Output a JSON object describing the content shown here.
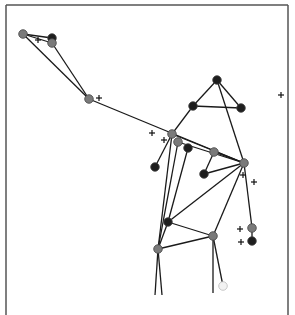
{
  "diagram": {
    "type": "pose-skeleton",
    "frame": {
      "left": 6,
      "top": 5,
      "right": 288,
      "bottom": 315,
      "color": "#555555"
    },
    "colors": {
      "edge": "#1a1a1a",
      "gray_node": "#7a7a7a",
      "dark_node": "#1e1e1e",
      "white_node": "#f2f2f2",
      "marker": "#111111"
    },
    "nodes": [
      {
        "id": "A",
        "x": 23,
        "y": 34,
        "kind": "gray"
      },
      {
        "id": "B",
        "x": 52,
        "y": 38,
        "kind": "dark"
      },
      {
        "id": "C",
        "x": 52,
        "y": 43,
        "kind": "gray"
      },
      {
        "id": "D",
        "x": 89,
        "y": 99,
        "kind": "gray"
      },
      {
        "id": "E",
        "x": 217,
        "y": 80,
        "kind": "dark"
      },
      {
        "id": "F",
        "x": 193,
        "y": 106,
        "kind": "dark"
      },
      {
        "id": "G",
        "x": 241,
        "y": 108,
        "kind": "dark"
      },
      {
        "id": "H",
        "x": 172,
        "y": 134,
        "kind": "gray"
      },
      {
        "id": "I",
        "x": 178,
        "y": 142,
        "kind": "gray"
      },
      {
        "id": "J",
        "x": 188,
        "y": 148,
        "kind": "dark"
      },
      {
        "id": "K",
        "x": 214,
        "y": 152,
        "kind": "gray"
      },
      {
        "id": "L",
        "x": 155,
        "y": 167,
        "kind": "dark"
      },
      {
        "id": "M",
        "x": 204,
        "y": 174,
        "kind": "dark"
      },
      {
        "id": "N",
        "x": 244,
        "y": 163,
        "kind": "gray"
      },
      {
        "id": "O",
        "x": 168,
        "y": 222,
        "kind": "dark"
      },
      {
        "id": "P",
        "x": 213,
        "y": 236,
        "kind": "gray"
      },
      {
        "id": "Q",
        "x": 158,
        "y": 249,
        "kind": "gray"
      },
      {
        "id": "R",
        "x": 252,
        "y": 228,
        "kind": "gray"
      },
      {
        "id": "S",
        "x": 252,
        "y": 241,
        "kind": "dark"
      },
      {
        "id": "T",
        "x": 223,
        "y": 286,
        "kind": "white"
      }
    ],
    "edges": [
      [
        "A",
        "B"
      ],
      [
        "A",
        "C"
      ],
      [
        "B",
        "C"
      ],
      [
        "A",
        "D"
      ],
      [
        "C",
        "D"
      ],
      [
        "D",
        "N"
      ],
      [
        "E",
        "F"
      ],
      [
        "E",
        "G"
      ],
      [
        "F",
        "G"
      ],
      [
        "E",
        "N"
      ],
      [
        "F",
        "H"
      ],
      [
        "H",
        "L"
      ],
      [
        "H",
        "N"
      ],
      [
        "I",
        "N"
      ],
      [
        "J",
        "O"
      ],
      [
        "K",
        "N"
      ],
      [
        "K",
        "M"
      ],
      [
        "M",
        "N"
      ],
      [
        "H",
        "Q"
      ],
      [
        "I",
        "Q"
      ],
      [
        "N",
        "O"
      ],
      [
        "N",
        "P"
      ],
      [
        "N",
        "R"
      ],
      [
        "R",
        "S"
      ],
      [
        "O",
        "P"
      ],
      [
        "O",
        "Q"
      ],
      [
        "Q",
        "P"
      ],
      [
        "P",
        "T"
      ]
    ],
    "open_edges": [
      {
        "from": "Q",
        "to": [
          155,
          295
        ]
      },
      {
        "from": "Q",
        "to": [
          162,
          295
        ]
      },
      {
        "from": "P",
        "to": [
          213,
          293
        ]
      }
    ],
    "markers": [
      {
        "x": 99,
        "y": 98
      },
      {
        "x": 281,
        "y": 95
      },
      {
        "x": 152,
        "y": 133
      },
      {
        "x": 164,
        "y": 140
      },
      {
        "x": 243,
        "y": 175
      },
      {
        "x": 254,
        "y": 182
      },
      {
        "x": 240,
        "y": 229
      },
      {
        "x": 241,
        "y": 242
      },
      {
        "x": 38,
        "y": 40
      }
    ]
  }
}
